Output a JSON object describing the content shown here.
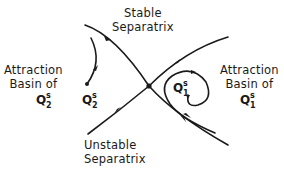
{
  "diagram": {
    "type": "phase-portrait-saddle",
    "labels": {
      "stable_separatrix": [
        "Stable",
        "Separatrix"
      ],
      "unstable_separatrix": [
        "Unstable",
        "Separatrix"
      ],
      "basin_left": [
        "Attraction",
        "Basin of"
      ],
      "basin_right": [
        "Attraction",
        "Basin of"
      ]
    },
    "points": {
      "q2_basin_label": {
        "base": "Q",
        "sup": "s",
        "sub": "2"
      },
      "q2_attractor": {
        "base": "Q",
        "sup": "s",
        "sub": "2"
      },
      "q1_attractor": {
        "base": "Q",
        "sup": "s",
        "sub": "1"
      },
      "q1_basin_label": {
        "base": "Q",
        "sup": "s",
        "sub": "1"
      }
    },
    "colors": {
      "line": "#1a1a1a",
      "background": "#ffffff"
    }
  }
}
